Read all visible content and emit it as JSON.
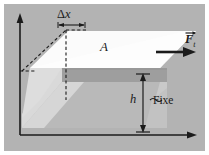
{
  "figure": {
    "width": 209,
    "height": 155,
    "background_color": "#b3b3b3",
    "border_color": "#ffffff",
    "line_color": "#1b1b1b"
  },
  "labels": {
    "delta_x": "Δx",
    "delta_x_symbol": "Δ",
    "delta_x_variable": "x",
    "area": "A",
    "height": "h",
    "fixed": "Fixe",
    "fixed_marker": "~",
    "force": "F",
    "force_subscript": "t",
    "force_full": "Ft"
  },
  "axes": {
    "vertical_axis_name": "vertical-axis",
    "horizontal_axis_name": "horizontal-axis",
    "arrowheads": "filled-triangle"
  },
  "geometry": {
    "top_face_fill": "#fbfbfb",
    "mid_band_fill": "#9d9d9d",
    "lower_body_fill": "#b8b8b8",
    "left_wedge_fill": "#d4d4d4",
    "right_wedge_fill": "#c6c6c6",
    "front_face_fill": "#c0c0c0",
    "dashed_guide_color": "#1b1b1b",
    "force_arrow_color": "#1b1b1b"
  },
  "annotations": {
    "delta_x_bracket": "dimension-bracket",
    "height_dimension": "vertical-dimension-line",
    "shear_guide": "dashed-shear-guide"
  }
}
